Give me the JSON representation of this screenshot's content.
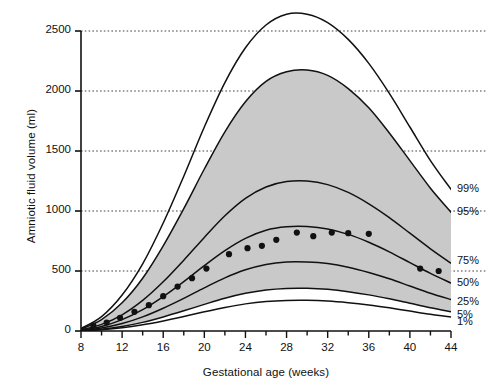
{
  "chart_data": {
    "type": "line",
    "title": "",
    "xlabel": "Gestational age (weeks)",
    "ylabel": "Amniotic fluid volume (ml)",
    "xlim": [
      8,
      44
    ],
    "ylim": [
      0,
      2650
    ],
    "grid": "horizontal dotted gridlines at y ticks",
    "legend_position": "right of plot, at curve endpoints",
    "xticks": [
      8,
      12,
      16,
      20,
      24,
      28,
      32,
      36,
      40,
      44
    ],
    "xtick_labels": [
      "8",
      "12",
      "16",
      "20",
      "24",
      "28",
      "32",
      "36",
      "40",
      "44"
    ],
    "xminor_tick_step": 2,
    "yticks": [
      0,
      500,
      1000,
      1500,
      2000,
      2500
    ],
    "ytick_labels": [
      "0",
      "500",
      "1000",
      "1500",
      "2000",
      "2500"
    ],
    "shaded_band": {
      "label": "5th to 95th percentile band",
      "color": "#c9c9c9",
      "lower_series": "5%",
      "upper_series": "95%"
    },
    "x": [
      8,
      10,
      12,
      14,
      16,
      18,
      20,
      22,
      24,
      26,
      28,
      30,
      32,
      34,
      36,
      38,
      40,
      42,
      44
    ],
    "series": [
      {
        "name": "99%",
        "label": "99%",
        "values": [
          20,
          120,
          300,
          560,
          900,
          1290,
          1700,
          2070,
          2360,
          2550,
          2640,
          2640,
          2570,
          2430,
          2230,
          1980,
          1700,
          1420,
          1180
        ]
      },
      {
        "name": "95%",
        "label": "95%",
        "values": [
          15,
          95,
          235,
          440,
          710,
          1020,
          1350,
          1660,
          1910,
          2080,
          2160,
          2175,
          2130,
          2020,
          1860,
          1650,
          1420,
          1190,
          990
        ]
      },
      {
        "name": "75%",
        "label": "75%",
        "values": [
          10,
          55,
          135,
          255,
          410,
          590,
          780,
          960,
          1105,
          1200,
          1245,
          1250,
          1220,
          1155,
          1060,
          945,
          815,
          685,
          565
        ]
      },
      {
        "name": "50%",
        "label": "50%",
        "values": [
          8,
          38,
          95,
          178,
          287,
          412,
          545,
          670,
          772,
          840,
          868,
          870,
          850,
          805,
          740,
          660,
          570,
          480,
          400
        ]
      },
      {
        "name": "25%",
        "label": "25%",
        "values": [
          5,
          25,
          62,
          118,
          190,
          272,
          360,
          443,
          510,
          555,
          575,
          575,
          562,
          532,
          488,
          435,
          375,
          315,
          262
        ]
      },
      {
        "name": "5%",
        "label": "5%",
        "values": [
          3,
          15,
          38,
          72,
          117,
          168,
          222,
          273,
          314,
          342,
          355,
          356,
          347,
          328,
          301,
          268,
          231,
          194,
          161
        ]
      },
      {
        "name": "1%",
        "label": "1%",
        "values": [
          2,
          11,
          27,
          52,
          84,
          121,
          160,
          196,
          226,
          246,
          255,
          256,
          250,
          236,
          217,
          193,
          166,
          139,
          116
        ]
      }
    ],
    "scatter": {
      "name": "observed means",
      "marker": "filled circle",
      "color": "#111111",
      "points": [
        {
          "x": 9.2,
          "y": 45
        },
        {
          "x": 10.5,
          "y": 70
        },
        {
          "x": 11.8,
          "y": 110
        },
        {
          "x": 13.2,
          "y": 160
        },
        {
          "x": 14.6,
          "y": 215
        },
        {
          "x": 16.0,
          "y": 290
        },
        {
          "x": 17.4,
          "y": 370
        },
        {
          "x": 18.8,
          "y": 440
        },
        {
          "x": 20.2,
          "y": 520
        },
        {
          "x": 22.4,
          "y": 640
        },
        {
          "x": 24.2,
          "y": 690
        },
        {
          "x": 25.6,
          "y": 710
        },
        {
          "x": 27.0,
          "y": 760
        },
        {
          "x": 29.0,
          "y": 820
        },
        {
          "x": 30.6,
          "y": 790
        },
        {
          "x": 32.4,
          "y": 820
        },
        {
          "x": 34.0,
          "y": 815
        },
        {
          "x": 36.0,
          "y": 810
        },
        {
          "x": 41.0,
          "y": 520
        },
        {
          "x": 42.8,
          "y": 500
        }
      ]
    }
  },
  "axis": {
    "ylabel": "Amniotic fluid volume (ml)",
    "xlabel": "Gestational age (weeks)"
  }
}
